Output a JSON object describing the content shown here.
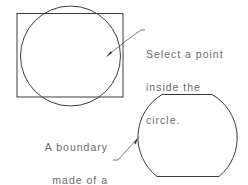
{
  "diagram": {
    "stroke_color": "#3a3a3a",
    "text_color": "#6a6a6a",
    "callout_top": {
      "lines": [
        "Select a point",
        "inside the",
        "circle."
      ]
    },
    "callout_bottom": {
      "lines": [
        "A boundary",
        "made of a",
        "polyline",
        "is created."
      ]
    },
    "shapes": {
      "rectangle": {
        "x": 17,
        "y": 13,
        "width": 106,
        "height": 84
      },
      "circle": {
        "cx": 70.5,
        "cy": 56,
        "r": 50
      },
      "boundary_polyline": {
        "top_y": 94,
        "bottom_y": 177,
        "left_x": 138,
        "right_x": 236
      }
    }
  }
}
